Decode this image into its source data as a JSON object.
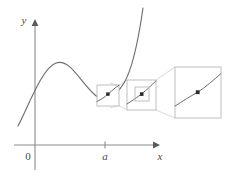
{
  "figure": {
    "kind": "math-diagram",
    "background_color": "#ffffff"
  },
  "axes": {
    "x_label": "x",
    "y_label": "y",
    "origin_label": "0",
    "tick_label": "a",
    "axis_color": "#8c8c8c",
    "label_color": "#4a4a4a",
    "origin_px": {
      "x": 35,
      "y": 145
    },
    "x_axis": {
      "x1": 14,
      "y1": 145,
      "x2": 157,
      "y2": 145
    },
    "y_axis": {
      "x1": 35,
      "y1": 170,
      "x2": 35,
      "y2": 22
    },
    "tick_a_px": {
      "x": 105,
      "y": 145
    }
  },
  "curve": {
    "color": "#6e6e6e",
    "description": "cubic-like curve rising from lower left, local maximum, local minimum near x = a, then rising steeply",
    "path": "M 18,126 C 30,104 42,68 56,63 C 70,58 80,82 95,95 C 104,103 114,98 124,82 C 133,67 139,36 143,8",
    "local_max_px": {
      "x": 57,
      "y": 62
    },
    "local_min_px": {
      "x": 96,
      "y": 96
    }
  },
  "zoom_boxes": [
    {
      "id": "zoom-box-1",
      "label": "first magnification region",
      "x": 97,
      "y": 85,
      "width": 22,
      "height": 21,
      "stroke": "#b9b9b9",
      "dot": {
        "x": 108,
        "y": 94
      },
      "curve_path": "M 97,101 C 102,99 105,97 108,94 C 112,90 116,87 119,85"
    },
    {
      "id": "zoom-box-2",
      "label": "second magnification region",
      "x": 127,
      "y": 80,
      "width": 29,
      "height": 30,
      "stroke": "#b9b9b9",
      "dot": {
        "x": 142,
        "y": 94
      },
      "curve_path": "M 127,104 C 133,100 138,97 142,94 C 147,90 152,85 156,81",
      "inner_box": {
        "x": 135,
        "y": 87,
        "width": 14,
        "height": 14
      }
    },
    {
      "id": "zoom-box-3",
      "label": "third magnification region",
      "x": 175,
      "y": 67,
      "width": 46,
      "height": 51,
      "stroke": "#b9b9b9",
      "dot": {
        "x": 198,
        "y": 92
      },
      "curve_path": "M 175,106 C 184,100 191,96 198,92 C 206,87 213,80 221,74"
    }
  ],
  "connectors": [
    {
      "id": "connector-1-top",
      "from": {
        "x": 119,
        "y": 85
      },
      "to": {
        "x": 127,
        "y": 80
      }
    },
    {
      "id": "connector-1-bottom",
      "from": {
        "x": 119,
        "y": 106
      },
      "to": {
        "x": 127,
        "y": 110
      }
    },
    {
      "id": "connector-2-top",
      "from": {
        "x": 149,
        "y": 87
      },
      "to": {
        "x": 156,
        "y": 80
      }
    },
    {
      "id": "connector-2-bottom",
      "from": {
        "x": 149,
        "y": 101
      },
      "to": {
        "x": 156,
        "y": 110
      }
    },
    {
      "id": "connector-3-top",
      "from": {
        "x": 156,
        "y": 80
      },
      "to": {
        "x": 175,
        "y": 67
      }
    },
    {
      "id": "connector-3-bottom",
      "from": {
        "x": 156,
        "y": 110
      },
      "to": {
        "x": 175,
        "y": 118
      }
    },
    {
      "id": "connector-0-top",
      "from": {
        "x": 110,
        "y": 82
      },
      "to": {
        "x": 119,
        "y": 85
      }
    },
    {
      "id": "connector-0-bottom",
      "from": {
        "x": 110,
        "y": 109
      },
      "to": {
        "x": 119,
        "y": 106
      }
    }
  ]
}
